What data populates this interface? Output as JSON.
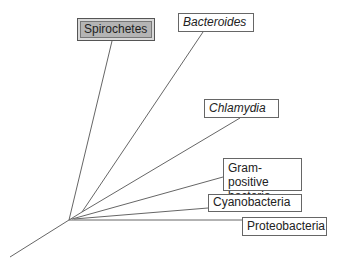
{
  "diagram": {
    "type": "unrooted-phylogenetic-tree",
    "line_color": "#666666",
    "highlight_fill": "#b4b4b4",
    "root": {
      "x": 69,
      "y": 220,
      "tail": {
        "x": 10,
        "y": 257
      }
    },
    "inner_node": {
      "x": 82,
      "y": 212
    },
    "taxa": [
      {
        "id": "spirochetes",
        "label": "Spirochetes",
        "italic": false,
        "highlighted": true,
        "box": {
          "x": 77,
          "y": 18,
          "w": 78,
          "h": 23
        },
        "branch_from": "root",
        "branch_to": {
          "x": 112,
          "y": 41
        }
      },
      {
        "id": "bacteroides",
        "label": "Bacteroides",
        "italic": true,
        "highlighted": false,
        "box": {
          "x": 178,
          "y": 13,
          "w": 76,
          "h": 19
        },
        "branch_from": "inner",
        "branch_to": {
          "x": 203,
          "y": 32
        }
      },
      {
        "id": "chlamydia",
        "label": "Chlamydia",
        "italic": true,
        "highlighted": false,
        "box": {
          "x": 204,
          "y": 99,
          "w": 75,
          "h": 19
        },
        "branch_from": "inner",
        "branch_to": {
          "x": 240,
          "y": 118
        }
      },
      {
        "id": "gram-positive",
        "label_lines": [
          "Gram-positive",
          "bacteria"
        ],
        "italic": false,
        "highlighted": false,
        "box": {
          "x": 223,
          "y": 158,
          "w": 79,
          "h": 33
        },
        "branch_from": "root",
        "branch_to": {
          "x": 223,
          "y": 177
        }
      },
      {
        "id": "cyanobacteria",
        "label": "Cyanobacteria",
        "italic": false,
        "highlighted": false,
        "box": {
          "x": 208,
          "y": 194,
          "w": 94,
          "h": 18
        },
        "branch_from": "root",
        "branch_to": {
          "x": 208,
          "y": 208
        }
      },
      {
        "id": "proteobacteria",
        "label": "Proteobacteria",
        "italic": false,
        "highlighted": false,
        "box": {
          "x": 242,
          "y": 217,
          "w": 85,
          "h": 19
        },
        "branch_from": "root",
        "branch_to": {
          "x": 242,
          "y": 220
        }
      }
    ]
  }
}
